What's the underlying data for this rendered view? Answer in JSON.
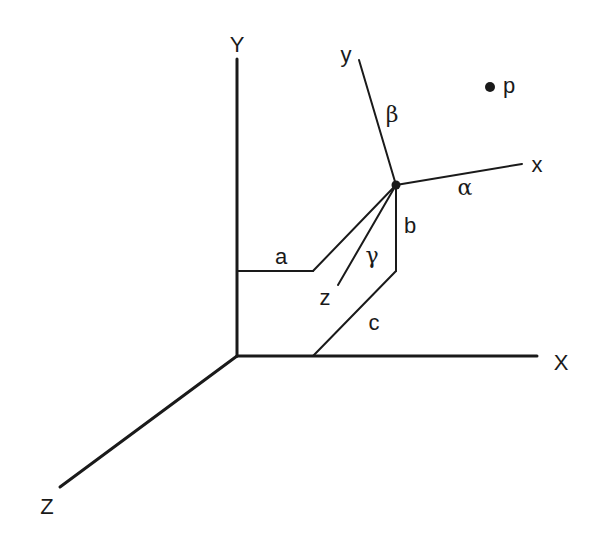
{
  "diagram": {
    "type": "coordinate-frame-rotation",
    "world_axes": {
      "x_label": "X",
      "y_label": "Y",
      "z_label": "Z"
    },
    "local_axes": {
      "x_label": "x",
      "y_label": "y",
      "z_label": "z"
    },
    "angles": {
      "alpha": "α",
      "beta": "β",
      "gamma": "γ"
    },
    "offsets": {
      "a": "a",
      "b": "b",
      "c": "c"
    },
    "point": {
      "label": "p"
    },
    "colors": {
      "ink": "#1a1a1a",
      "background": "#ffffff"
    }
  }
}
